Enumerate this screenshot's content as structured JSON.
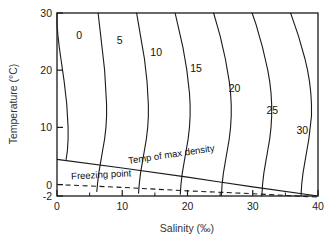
{
  "chart_data": {
    "type": "line",
    "title": "",
    "subtitle": "",
    "xlabel": "Salinity (‰)",
    "ylabel": "Temperature (°C)",
    "xlim": [
      0,
      40
    ],
    "ylim": [
      -2,
      30
    ],
    "xticks": [
      0,
      10,
      20,
      30,
      40
    ],
    "xtick_labels": [
      "0",
      "10",
      "20",
      "30",
      "40"
    ],
    "xminor_ticks": [
      5,
      15,
      25,
      35
    ],
    "yticks": [
      -2,
      0,
      10,
      20,
      30
    ],
    "ytick_labels": [
      "-2",
      "0",
      "10",
      "20",
      "30"
    ],
    "grid": false,
    "legend": "none",
    "legend_position": "none",
    "series": [
      {
        "name": "sigma-t 0",
        "label": "0",
        "label_xy": [
          3.4,
          26.2
        ],
        "points": [
          [
            0.0,
            30.0
          ],
          [
            0.0,
            28.0
          ],
          [
            0.15,
            26.0
          ],
          [
            0.35,
            24.0
          ],
          [
            0.6,
            22.0
          ],
          [
            0.85,
            20.0
          ],
          [
            1.1,
            18.0
          ],
          [
            1.3,
            16.0
          ],
          [
            1.5,
            14.0
          ],
          [
            1.6,
            12.0
          ],
          [
            1.7,
            10.0
          ],
          [
            1.7,
            8.0
          ],
          [
            1.6,
            6.0
          ],
          [
            1.4,
            4.4
          ]
        ]
      },
      {
        "name": "sigma-t 5",
        "label": "5",
        "label_xy": [
          9.6,
          25.3
        ],
        "points": [
          [
            6.3,
            30.0
          ],
          [
            6.5,
            28.0
          ],
          [
            6.7,
            26.0
          ],
          [
            6.9,
            24.0
          ],
          [
            7.1,
            22.0
          ],
          [
            7.3,
            20.0
          ],
          [
            7.4,
            18.0
          ],
          [
            7.5,
            16.0
          ],
          [
            7.6,
            14.0
          ],
          [
            7.6,
            12.0
          ],
          [
            7.5,
            10.0
          ],
          [
            7.3,
            8.0
          ],
          [
            7.0,
            6.0
          ],
          [
            6.7,
            4.0
          ],
          [
            6.4,
            2.0
          ],
          [
            6.2,
            0.0
          ],
          [
            6.1,
            -1.2
          ]
        ]
      },
      {
        "name": "sigma-t 10",
        "label": "10",
        "label_xy": [
          15.2,
          23.1
        ],
        "points": [
          [
            12.2,
            30.0
          ],
          [
            12.5,
            28.0
          ],
          [
            12.8,
            26.0
          ],
          [
            13.1,
            24.0
          ],
          [
            13.4,
            22.0
          ],
          [
            13.6,
            20.0
          ],
          [
            13.8,
            18.0
          ],
          [
            13.9,
            16.0
          ],
          [
            14.0,
            14.0
          ],
          [
            14.0,
            12.0
          ],
          [
            13.9,
            10.0
          ],
          [
            13.7,
            8.0
          ],
          [
            13.4,
            6.0
          ],
          [
            13.1,
            4.0
          ],
          [
            12.8,
            2.0
          ],
          [
            12.6,
            0.0
          ],
          [
            12.5,
            -1.5
          ]
        ]
      },
      {
        "name": "sigma-t 15",
        "label": "15",
        "label_xy": [
          21.3,
          20.4
        ],
        "points": [
          [
            18.1,
            30.0
          ],
          [
            18.5,
            28.0
          ],
          [
            18.9,
            26.0
          ],
          [
            19.3,
            24.0
          ],
          [
            19.6,
            22.0
          ],
          [
            19.9,
            20.0
          ],
          [
            20.1,
            18.0
          ],
          [
            20.3,
            16.0
          ],
          [
            20.4,
            14.0
          ],
          [
            20.4,
            12.0
          ],
          [
            20.3,
            10.0
          ],
          [
            20.1,
            8.0
          ],
          [
            19.8,
            6.0
          ],
          [
            19.5,
            4.0
          ],
          [
            19.2,
            2.0
          ],
          [
            19.0,
            0.0
          ],
          [
            18.9,
            -1.7
          ]
        ]
      },
      {
        "name": "sigma-t 20",
        "label": "20",
        "label_xy": [
          27.2,
          16.8
        ],
        "points": [
          [
            24.0,
            30.0
          ],
          [
            24.5,
            28.0
          ],
          [
            25.0,
            26.0
          ],
          [
            25.4,
            24.0
          ],
          [
            25.8,
            22.0
          ],
          [
            26.1,
            20.0
          ],
          [
            26.4,
            18.0
          ],
          [
            26.6,
            16.0
          ],
          [
            26.7,
            14.0
          ],
          [
            26.7,
            12.0
          ],
          [
            26.6,
            10.0
          ],
          [
            26.4,
            8.0
          ],
          [
            26.1,
            6.0
          ],
          [
            25.8,
            4.0
          ],
          [
            25.5,
            2.0
          ],
          [
            25.3,
            0.0
          ],
          [
            25.2,
            -1.9
          ]
        ]
      },
      {
        "name": "sigma-t 25",
        "label": "25",
        "label_xy": [
          33.0,
          13.0
        ],
        "points": [
          [
            29.9,
            30.0
          ],
          [
            30.5,
            28.0
          ],
          [
            31.0,
            26.0
          ],
          [
            31.5,
            24.0
          ],
          [
            31.9,
            22.0
          ],
          [
            32.3,
            20.0
          ],
          [
            32.6,
            18.0
          ],
          [
            32.8,
            16.0
          ],
          [
            32.9,
            14.0
          ],
          [
            32.9,
            12.0
          ],
          [
            32.8,
            10.0
          ],
          [
            32.6,
            8.0
          ],
          [
            32.3,
            6.0
          ],
          [
            32.0,
            4.0
          ],
          [
            31.7,
            2.0
          ],
          [
            31.5,
            0.0
          ],
          [
            31.4,
            -2.0
          ]
        ]
      },
      {
        "name": "sigma-t 30",
        "label": "30",
        "label_xy": [
          37.6,
          9.5
        ],
        "points": [
          [
            35.8,
            30.0
          ],
          [
            36.4,
            28.0
          ],
          [
            37.0,
            26.0
          ],
          [
            37.5,
            24.0
          ],
          [
            38.0,
            22.0
          ],
          [
            38.4,
            20.0
          ],
          [
            38.7,
            18.0
          ],
          [
            38.9,
            16.0
          ],
          [
            39.0,
            14.0
          ],
          [
            39.0,
            12.0
          ],
          [
            38.8,
            10.0
          ],
          [
            38.6,
            8.0
          ],
          [
            38.3,
            6.0
          ],
          [
            38.0,
            4.0
          ],
          [
            37.7,
            2.0
          ],
          [
            37.5,
            0.0
          ],
          [
            37.4,
            -2.0
          ]
        ]
      }
    ],
    "annotations": [
      {
        "name": "temp-of-max-density",
        "text": "Temp of max density",
        "style": "solid",
        "label_xy": [
          11.0,
          3.6
        ],
        "label_rotation": -8.5,
        "points": [
          [
            0.0,
            4.4
          ],
          [
            10.0,
            2.9
          ],
          [
            20.0,
            1.3
          ],
          [
            24.7,
            0.5
          ],
          [
            30.0,
            -0.4
          ],
          [
            40.0,
            -2.0
          ]
        ]
      },
      {
        "name": "freezing-point",
        "text": "Freezing point",
        "style": "dashed",
        "label_xy": [
          2.2,
          0.9
        ],
        "label_rotation": -3.0,
        "points": [
          [
            0.0,
            0.0
          ],
          [
            10.0,
            -0.5
          ],
          [
            20.0,
            -1.1
          ],
          [
            30.0,
            -1.6
          ],
          [
            40.0,
            -2.2
          ]
        ]
      }
    ]
  },
  "colors": {
    "frame": "#1a1a1a",
    "contour": "#1a1a1a",
    "text": "#1a1a1a",
    "background": "#ffffff"
  }
}
